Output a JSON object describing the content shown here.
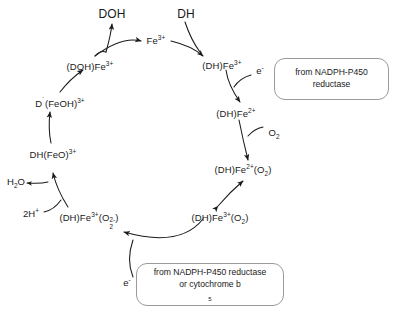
{
  "diagram": {
    "nodes": {
      "doh": "DOH",
      "dh": "DH",
      "fe3": "Fe",
      "fe3_charge": "3+",
      "dh_fe3": "(DH)Fe",
      "dh_fe3_charge": "3+",
      "dh_fe2": "(DH)Fe",
      "dh_fe2_charge": "2+",
      "dh_fe2_o2": "(DH)Fe",
      "dh_fe2_o2_charge": "2+",
      "dh_fe2_o2_tail_open": "(O",
      "dh_fe2_o2_tail_sub": "2",
      "dh_fe2_o2_tail_close": ")",
      "dh_fe3_o2": "(DH)Fe",
      "dh_fe3_o2_charge": "3+",
      "dh_fe3_o2_tail_open": "(O",
      "dh_fe3_o2_tail_sub": "2",
      "dh_fe3_o2_tail_close": ")",
      "dh_fe3_o2_dianion": "(DH)Fe",
      "dh_fe3_o2_dianion_charge": "3+",
      "dh_fe3_o2_dianion_open": "(O",
      "dh_fe3_o2_dianion_sub": "2",
      "dh_fe3_o2_dianion_sup": "2-",
      "dh_fe3_o2_dianion_close": ")",
      "dh_feo": "DH(FeO)",
      "dh_feo_charge": "3+",
      "d_feoh": "D",
      "d_feoh_radical": "˙",
      "d_feoh_body": "(FeOH)",
      "d_feoh_charge": "3+",
      "doh_fe3": "(DOH)Fe",
      "doh_fe3_charge": "3+"
    },
    "cofactors": {
      "electron_top": "e",
      "electron_top_charge": "-",
      "oxygen": "O",
      "oxygen_sub": "2",
      "water": "H",
      "water_sub": "2",
      "water_tail": "O",
      "protons": "2H",
      "protons_charge": "+",
      "electron_bottom": "e",
      "electron_bottom_charge": "-"
    },
    "callouts": {
      "top": {
        "line1": "from NADPH-P450",
        "line2": "reductase"
      },
      "bottom": {
        "line1": "from NADPH-P450  reductase",
        "line2_prefix": "or cytochrome b",
        "line2_sub": "5"
      }
    },
    "colors": {
      "stroke": "#1a1a1a",
      "callout_border": "#9a9a9a",
      "background": "#ffffff"
    }
  }
}
